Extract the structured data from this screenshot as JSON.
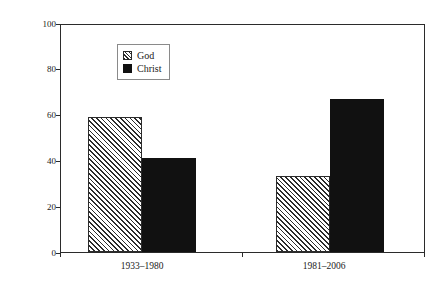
{
  "chart_data": {
    "type": "bar",
    "title": "",
    "xlabel": "",
    "ylabel": "Percentage of total references",
    "categories": [
      "1933–1980",
      "1981–2006"
    ],
    "series": [
      {
        "name": "God",
        "values": [
          59,
          33
        ]
      },
      {
        "name": "Christ",
        "values": [
          41,
          67
        ]
      }
    ],
    "ylim": [
      0,
      100
    ],
    "yticks": [
      0,
      20,
      40,
      60,
      80,
      100
    ],
    "ytick_labels": [
      "0",
      "20",
      "40",
      "60",
      "80",
      "100"
    ],
    "grid": false,
    "legend_position": "upper left",
    "colors": {
      "god": "#ffffff",
      "god_hatch": "#2b2b2b",
      "christ": "#111111",
      "axis": "#2b2b2b",
      "text": "#1a1a1a",
      "background": "#ffffff"
    }
  }
}
